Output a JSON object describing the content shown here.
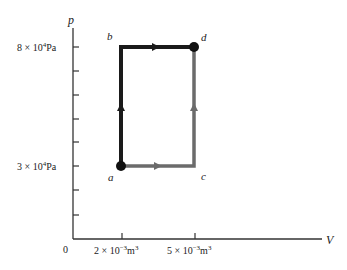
{
  "diagram": {
    "type": "pV-diagram",
    "axes": {
      "y_label": "p",
      "x_label": "V",
      "origin_label": "0",
      "y_ticks": [
        {
          "label_base": "8 × 10",
          "label_exp": "4",
          "label_unit": "Pa",
          "value": 80000
        },
        {
          "label_base": "3 × 10",
          "label_exp": "4",
          "label_unit": "Pa",
          "value": 30000
        }
      ],
      "x_ticks": [
        {
          "label_base": "2 × 10",
          "label_exp": "−3",
          "label_unit": "m",
          "label_unit_exp": "3",
          "value": 0.002
        },
        {
          "label_base": "5 × 10",
          "label_exp": "−3",
          "label_unit": "m",
          "label_unit_exp": "3",
          "value": 0.005
        }
      ]
    },
    "points": [
      {
        "id": "a",
        "label": "a",
        "V": 0.002,
        "p": 30000,
        "marked": true
      },
      {
        "id": "b",
        "label": "b",
        "V": 0.002,
        "p": 80000,
        "marked": false
      },
      {
        "id": "c",
        "label": "c",
        "V": 0.005,
        "p": 30000,
        "marked": false
      },
      {
        "id": "d",
        "label": "d",
        "V": 0.005,
        "p": 80000,
        "marked": true
      }
    ],
    "paths": [
      {
        "from": "a",
        "to": "b",
        "color": "#1a1a1a",
        "direction": "up"
      },
      {
        "from": "b",
        "to": "d",
        "color": "#1a1a1a",
        "direction": "right"
      },
      {
        "from": "a",
        "to": "c",
        "color": "#6b6b6b",
        "direction": "right"
      },
      {
        "from": "c",
        "to": "d",
        "color": "#6b6b6b",
        "direction": "up"
      }
    ],
    "colors": {
      "path_abd": "#1a1a1a",
      "path_acd": "#6b6b6b",
      "axis": "#333333"
    }
  }
}
